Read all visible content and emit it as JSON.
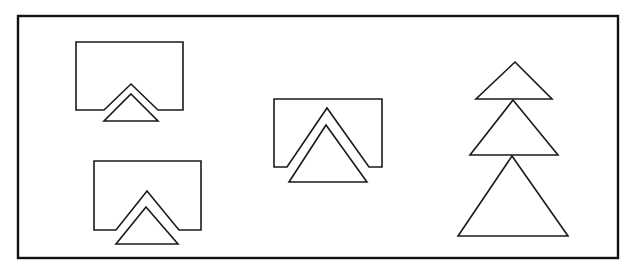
{
  "diagram": {
    "stroke_color": "#1a1a1a",
    "background": "#ffffff",
    "frame": {
      "x": 18,
      "y": 16,
      "w": 600,
      "h": 242
    },
    "figures": [
      {
        "id": "fig-1",
        "name": "notched-rectangle-with-small-triangle-top-left",
        "notched_rect": "M104,110 L76,110 L76,42 L183,42 L183,110 L158,110 L131,84 Z",
        "triangle": "M131,94 L158,121 L104,121 Z"
      },
      {
        "id": "fig-2",
        "name": "notched-rectangle-with-triangle-bottom-left",
        "notched_rect": "M116,230 L94,230 L94,161 L201,161 L201,230 L179,230 L147,191 Z",
        "triangle": "M146,207 L178,244 L116,244 Z"
      },
      {
        "id": "fig-3",
        "name": "notched-rectangle-with-large-triangle-center",
        "notched_rect": "M287,167 L274,167 L274,99 L382,99 L382,167 L369,167 L327,108 Z",
        "triangle": "M326,125 L367,182 L289,182 Z"
      },
      {
        "id": "fig-4",
        "name": "stacked-triangles-right",
        "triangles": [
          "M515,62 L552,99 L476,99 Z",
          "M513,100 L558,155 L470,155 Z",
          "M512,156 L568,236 L458,236 Z"
        ]
      }
    ]
  }
}
